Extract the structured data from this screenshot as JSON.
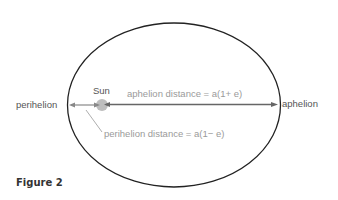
{
  "diagram": {
    "labels": {
      "perihelion": "perihelion",
      "aphelion": "aphelion",
      "sun": "Sun",
      "aphelion_distance": "aphelion distance = a(1+ e)",
      "perihelion_distance": "perihelion distance = a(1− e)"
    },
    "caption": "Figure 2",
    "colors": {
      "orbit": "#222222",
      "axis": "#666666",
      "sun": "#b8b8b8",
      "grey_text": "#9a9a9a"
    }
  }
}
